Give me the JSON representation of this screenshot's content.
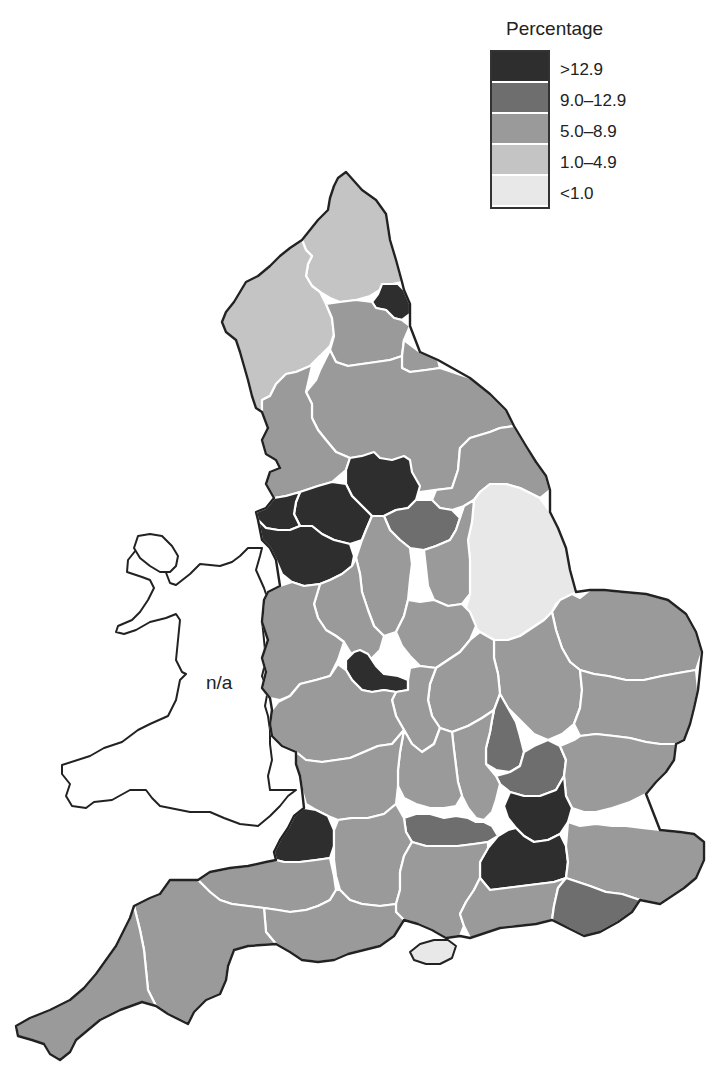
{
  "map": {
    "region": "England and Wales",
    "unit_label": "Percentage",
    "wales_label": "n/a"
  },
  "legend": {
    "title": "Percentage",
    "classes": [
      {
        "label": ">12.9",
        "color": "#2e2e2e"
      },
      {
        "label": "9.0–12.9",
        "color": "#6e6e6e"
      },
      {
        "label": "5.0–8.9",
        "color": "#9a9a9a"
      },
      {
        "label": "1.0–4.9",
        "color": "#c4c4c4"
      },
      {
        "label": "<1.0",
        "color": "#e8e8e8"
      }
    ]
  },
  "regions": [
    {
      "name": "Northumberland",
      "class": "1.0–4.9"
    },
    {
      "name": "Cumbria",
      "class": "1.0–4.9"
    },
    {
      "name": "Tyne and Wear",
      "class": ">12.9"
    },
    {
      "name": "Durham",
      "class": "5.0–8.9"
    },
    {
      "name": "Cleveland",
      "class": "5.0–8.9"
    },
    {
      "name": "North Yorkshire",
      "class": "5.0–8.9"
    },
    {
      "name": "Lancashire",
      "class": "5.0–8.9"
    },
    {
      "name": "West Yorkshire",
      "class": ">12.9"
    },
    {
      "name": "Greater Manchester",
      "class": ">12.9"
    },
    {
      "name": "Merseyside",
      "class": ">12.9"
    },
    {
      "name": "South Yorkshire",
      "class": "9.0–12.9"
    },
    {
      "name": "Humberside",
      "class": "5.0–8.9"
    },
    {
      "name": "Lincolnshire",
      "class": "<1.0"
    },
    {
      "name": "Cheshire",
      "class": ">12.9"
    },
    {
      "name": "Derbyshire",
      "class": "5.0–8.9"
    },
    {
      "name": "Nottinghamshire",
      "class": "5.0–8.9"
    },
    {
      "name": "Staffordshire",
      "class": "5.0–8.9"
    },
    {
      "name": "Shropshire",
      "class": "5.0–8.9"
    },
    {
      "name": "West Midlands",
      "class": ">12.9"
    },
    {
      "name": "Leicestershire",
      "class": "5.0–8.9"
    },
    {
      "name": "Norfolk",
      "class": "5.0–8.9"
    },
    {
      "name": "Cambridgeshire",
      "class": "5.0–8.9"
    },
    {
      "name": "Suffolk",
      "class": "5.0–8.9"
    },
    {
      "name": "Northamptonshire",
      "class": "5.0–8.9"
    },
    {
      "name": "Warwickshire",
      "class": "5.0–8.9"
    },
    {
      "name": "Hereford and Worcester",
      "class": "5.0–8.9"
    },
    {
      "name": "Bedfordshire",
      "class": "9.0–12.9"
    },
    {
      "name": "Hertfordshire",
      "class": "9.0–12.9"
    },
    {
      "name": "Buckinghamshire",
      "class": "5.0–8.9"
    },
    {
      "name": "Oxfordshire",
      "class": "5.0–8.9"
    },
    {
      "name": "Gloucestershire",
      "class": "5.0–8.9"
    },
    {
      "name": "Essex",
      "class": "5.0–8.9"
    },
    {
      "name": "Greater London",
      "class": ">12.9"
    },
    {
      "name": "Berkshire",
      "class": "9.0–12.9"
    },
    {
      "name": "Avon",
      "class": ">12.9"
    },
    {
      "name": "Wiltshire",
      "class": "5.0–8.9"
    },
    {
      "name": "Surrey",
      "class": ">12.9"
    },
    {
      "name": "Kent",
      "class": "5.0–8.9"
    },
    {
      "name": "Hampshire",
      "class": "5.0–8.9"
    },
    {
      "name": "West Sussex",
      "class": "5.0–8.9"
    },
    {
      "name": "East Sussex",
      "class": "9.0–12.9"
    },
    {
      "name": "Isle of Wight",
      "class": "<1.0"
    },
    {
      "name": "Somerset",
      "class": "5.0–8.9"
    },
    {
      "name": "Dorset",
      "class": "5.0–8.9"
    },
    {
      "name": "Devon",
      "class": "5.0–8.9"
    },
    {
      "name": "Cornwall",
      "class": "5.0–8.9"
    }
  ]
}
